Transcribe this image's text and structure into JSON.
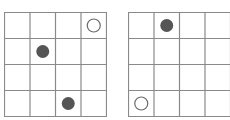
{
  "colors": {
    "line": "#8a8a8a",
    "filled": "#555555",
    "hollow_stroke": "#6a6a6a",
    "background": "#ffffff"
  },
  "grids": [
    {
      "id": "left",
      "rows": 4,
      "cols": 4,
      "pieces": [
        {
          "row": 0,
          "col": 3,
          "type": "hollow"
        },
        {
          "row": 1,
          "col": 1,
          "type": "filled"
        },
        {
          "row": 3,
          "col": 2,
          "type": "filled"
        }
      ]
    },
    {
      "id": "right",
      "rows": 4,
      "cols": 4,
      "pieces": [
        {
          "row": 0,
          "col": 1,
          "type": "filled"
        },
        {
          "row": 3,
          "col": 0,
          "type": "hollow"
        }
      ]
    }
  ]
}
